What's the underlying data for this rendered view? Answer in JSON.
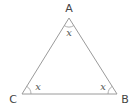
{
  "diagram": {
    "type": "triangle",
    "stroke_color": "#9a9a9a",
    "vertices": [
      {
        "name": "A",
        "label": "A",
        "x": 69,
        "y": 18,
        "label_x": 69,
        "label_y": 12
      },
      {
        "name": "B",
        "label": "B",
        "x": 117,
        "y": 94,
        "label_x": 125,
        "label_y": 103
      },
      {
        "name": "C",
        "label": "C",
        "x": 22,
        "y": 94,
        "label_x": 13,
        "label_y": 103
      }
    ],
    "angles": [
      {
        "vertex": "A",
        "label": "x"
      },
      {
        "vertex": "B",
        "label": "x"
      },
      {
        "vertex": "C",
        "label": "x"
      }
    ]
  }
}
